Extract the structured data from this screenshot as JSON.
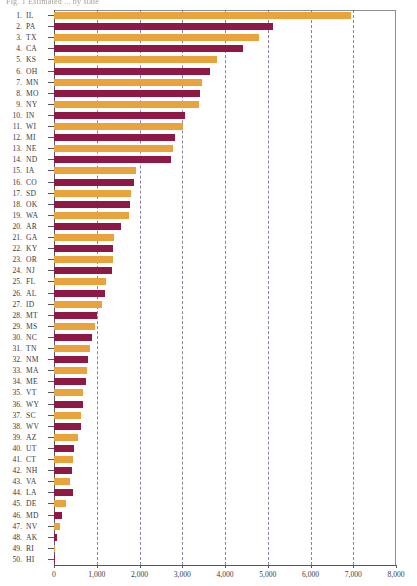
{
  "title": "Fig. 1  Estimated ... by state",
  "colors": {
    "bar_orange": "#E8A33D",
    "bar_maroon": "#8E1846",
    "gridline": "#6E6EA0",
    "axis": "#55555F",
    "text": "#3A3A44"
  },
  "chart_data": {
    "type": "bar",
    "orientation": "horizontal",
    "title": "Fig. 1  Estimated ... by state",
    "xlabel": "",
    "ylabel": "",
    "xlim": [
      0,
      8000
    ],
    "xticks": [
      0,
      1000,
      2000,
      3000,
      4000,
      5000,
      6000,
      7000,
      8000
    ],
    "xtick_labels": [
      "0",
      "1,000",
      "2,000",
      "3,000",
      "4,000",
      "5,000",
      "6,000",
      "7,000",
      "8,000"
    ],
    "grid": "vertical-dashed",
    "legend": null,
    "categories": [
      "IL",
      "PA",
      "TX",
      "CA",
      "KS",
      "OH",
      "MN",
      "MO",
      "NY",
      "IN",
      "WI",
      "MI",
      "NE",
      "ND",
      "IA",
      "CO",
      "SD",
      "OK",
      "WA",
      "AR",
      "GA",
      "KY",
      "OR",
      "NJ",
      "FL",
      "AL",
      "ID",
      "MT",
      "MS",
      "NC",
      "TN",
      "NM",
      "MA",
      "ME",
      "VT",
      "WY",
      "SC",
      "WV",
      "AZ",
      "UT",
      "CT",
      "NH",
      "VA",
      "LA",
      "DE",
      "MD",
      "NV",
      "AK",
      "RI",
      "HI"
    ],
    "values": [
      6950,
      5120,
      4800,
      4420,
      3810,
      3650,
      3460,
      3415,
      3390,
      3065,
      3015,
      2830,
      2780,
      2740,
      1920,
      1875,
      1805,
      1780,
      1755,
      1570,
      1405,
      1380,
      1380,
      1355,
      1215,
      1195,
      1125,
      1005,
      960,
      890,
      840,
      795,
      770,
      750,
      680,
      680,
      630,
      630,
      560,
      470,
      445,
      420,
      375,
      445,
      280,
      190,
      140,
      70,
      25,
      5
    ],
    "rows": [
      {
        "rank": "1.",
        "label": "IL",
        "value": 6950,
        "color": "orange"
      },
      {
        "rank": "2.",
        "label": "PA",
        "value": 5120,
        "color": "maroon"
      },
      {
        "rank": "3.",
        "label": "TX",
        "value": 4800,
        "color": "orange"
      },
      {
        "rank": "4.",
        "label": "CA",
        "value": 4420,
        "color": "maroon"
      },
      {
        "rank": "5.",
        "label": "KS",
        "value": 3810,
        "color": "orange"
      },
      {
        "rank": "6.",
        "label": "OH",
        "value": 3650,
        "color": "maroon"
      },
      {
        "rank": "7.",
        "label": "MN",
        "value": 3460,
        "color": "orange"
      },
      {
        "rank": "8.",
        "label": "MO",
        "value": 3415,
        "color": "maroon"
      },
      {
        "rank": "9.",
        "label": "NY",
        "value": 3390,
        "color": "orange"
      },
      {
        "rank": "10.",
        "label": "IN",
        "value": 3065,
        "color": "maroon"
      },
      {
        "rank": "11.",
        "label": "WI",
        "value": 3015,
        "color": "orange"
      },
      {
        "rank": "12.",
        "label": "MI",
        "value": 2830,
        "color": "maroon"
      },
      {
        "rank": "13.",
        "label": "NE",
        "value": 2780,
        "color": "orange"
      },
      {
        "rank": "14.",
        "label": "ND",
        "value": 2740,
        "color": "maroon"
      },
      {
        "rank": "15.",
        "label": "IA",
        "value": 1920,
        "color": "orange"
      },
      {
        "rank": "16.",
        "label": "CO",
        "value": 1875,
        "color": "maroon"
      },
      {
        "rank": "17.",
        "label": "SD",
        "value": 1805,
        "color": "orange"
      },
      {
        "rank": "18.",
        "label": "OK",
        "value": 1780,
        "color": "maroon"
      },
      {
        "rank": "19.",
        "label": "WA",
        "value": 1755,
        "color": "orange"
      },
      {
        "rank": "20.",
        "label": "AR",
        "value": 1570,
        "color": "maroon"
      },
      {
        "rank": "21.",
        "label": "GA",
        "value": 1405,
        "color": "orange"
      },
      {
        "rank": "22.",
        "label": "KY",
        "value": 1380,
        "color": "maroon"
      },
      {
        "rank": "23.",
        "label": "OR",
        "value": 1380,
        "color": "orange"
      },
      {
        "rank": "24.",
        "label": "NJ",
        "value": 1355,
        "color": "maroon"
      },
      {
        "rank": "25.",
        "label": "FL",
        "value": 1215,
        "color": "orange"
      },
      {
        "rank": "26.",
        "label": "AL",
        "value": 1195,
        "color": "maroon"
      },
      {
        "rank": "27.",
        "label": "ID",
        "value": 1125,
        "color": "orange"
      },
      {
        "rank": "28.",
        "label": "MT",
        "value": 1005,
        "color": "maroon"
      },
      {
        "rank": "29.",
        "label": "MS",
        "value": 960,
        "color": "orange"
      },
      {
        "rank": "30.",
        "label": "NC",
        "value": 890,
        "color": "maroon"
      },
      {
        "rank": "31.",
        "label": "TN",
        "value": 840,
        "color": "orange"
      },
      {
        "rank": "32.",
        "label": "NM",
        "value": 795,
        "color": "maroon"
      },
      {
        "rank": "33.",
        "label": "MA",
        "value": 770,
        "color": "orange"
      },
      {
        "rank": "34.",
        "label": "ME",
        "value": 750,
        "color": "maroon"
      },
      {
        "rank": "35.",
        "label": "VT",
        "value": 680,
        "color": "orange"
      },
      {
        "rank": "36.",
        "label": "WY",
        "value": 680,
        "color": "maroon"
      },
      {
        "rank": "37.",
        "label": "SC",
        "value": 630,
        "color": "orange"
      },
      {
        "rank": "38.",
        "label": "WV",
        "value": 630,
        "color": "maroon"
      },
      {
        "rank": "39.",
        "label": "AZ",
        "value": 560,
        "color": "orange"
      },
      {
        "rank": "40.",
        "label": "UT",
        "value": 470,
        "color": "maroon"
      },
      {
        "rank": "41.",
        "label": "CT",
        "value": 445,
        "color": "orange"
      },
      {
        "rank": "42.",
        "label": "NH",
        "value": 420,
        "color": "maroon"
      },
      {
        "rank": "43.",
        "label": "VA",
        "value": 375,
        "color": "orange"
      },
      {
        "rank": "44.",
        "label": "LA",
        "value": 445,
        "color": "maroon"
      },
      {
        "rank": "45.",
        "label": "DE",
        "value": 280,
        "color": "orange"
      },
      {
        "rank": "46.",
        "label": "MD",
        "value": 190,
        "color": "maroon"
      },
      {
        "rank": "47.",
        "label": "NV",
        "value": 140,
        "color": "orange"
      },
      {
        "rank": "48.",
        "label": "AK",
        "value": 70,
        "color": "maroon"
      },
      {
        "rank": "49.",
        "label": "RI",
        "value": 25,
        "color": "orange"
      },
      {
        "rank": "50.",
        "label": "HI",
        "value": 5,
        "color": "maroon"
      }
    ]
  }
}
